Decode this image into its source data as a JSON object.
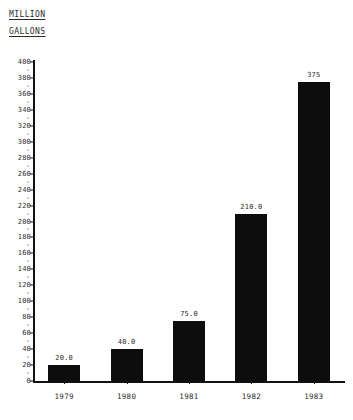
{
  "axis_title": {
    "line1": "MILLION",
    "line2": "GALLONS"
  },
  "caption": {
    "text": ""
  },
  "chart_data": {
    "type": "bar",
    "title": "",
    "subtitle": "",
    "xlabel": "",
    "ylabel": "MILLION GALLONS",
    "categories": [
      "1979",
      "1980",
      "1981",
      "1982",
      "1983"
    ],
    "values": [
      20.0,
      40.0,
      75.0,
      210.0,
      375
    ],
    "data_labels": [
      "20.0",
      "40.0",
      "75.0",
      "210.0",
      "375"
    ],
    "ylim": [
      0,
      400
    ],
    "ytick_step": 20,
    "yminor_step": 10,
    "ytick_labels": [
      "400",
      "380",
      "360",
      "340",
      "320",
      "300",
      "280",
      "260",
      "240",
      "220",
      "200",
      "180",
      "160",
      "140",
      "120",
      "100",
      "80",
      "60",
      "40",
      "20",
      "0"
    ],
    "ytick_values": [
      400,
      380,
      360,
      340,
      320,
      300,
      280,
      260,
      240,
      220,
      200,
      180,
      160,
      140,
      120,
      100,
      80,
      60,
      40,
      20,
      0
    ],
    "yminor_values": [
      390,
      370,
      350,
      330,
      310,
      290,
      270,
      250,
      230,
      210,
      190,
      170,
      150,
      130,
      110,
      90,
      70,
      50,
      30,
      10
    ],
    "minor_tick_glyph": "-",
    "grid": false,
    "legend": false,
    "legend_position": "none",
    "bar_color": "#0d0d0d",
    "axis_color": "#111111",
    "text_color": "#2b2b2b",
    "background": "#ffffff"
  }
}
